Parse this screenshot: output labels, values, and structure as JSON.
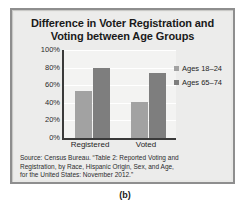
{
  "figure": {
    "caption": "(b)"
  },
  "chart_data": {
    "type": "bar",
    "title": "Difference in Voter Registration and Voting between Age Groups",
    "title_line1": "Difference in Voter Registration and",
    "title_line2": "Voting between Age Groups",
    "categories": [
      "Registered",
      "Voted"
    ],
    "series": [
      {
        "name": "Ages 18–24",
        "values": [
          53,
          41
        ],
        "color": "#a2a2a2"
      },
      {
        "name": "Ages 65–74",
        "values": [
          80,
          74
        ],
        "color": "#7e7e7e"
      }
    ],
    "xlabel": "",
    "ylabel": "",
    "ylim": [
      0,
      100
    ],
    "ytick_labels": [
      "100%",
      "80%",
      "60%",
      "40%",
      "20%",
      "0%"
    ],
    "ytick_values": [
      100,
      80,
      60,
      40,
      20,
      0
    ],
    "grid": true,
    "legend_position": "right",
    "source_lines": [
      "Source: Census Bureau. “Table 2: Reported Voting and",
      "Registration, by Race, Hispanic Origin, Sex, and Age,",
      "for the United States: November 2012.”"
    ],
    "source": "Source: Census Bureau. “Table 2: Reported Voting and Registration, by Race, Hispanic Origin, Sex, and Age, for the United States: November 2012.”"
  }
}
